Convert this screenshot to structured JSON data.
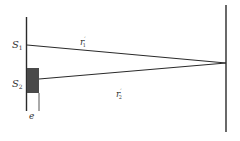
{
  "diagram": {
    "type": "double-slit interference with thin film over slit",
    "labels": {
      "s1": "S",
      "s1_sub": "1",
      "s2": "S",
      "s2_sub": "2",
      "r1": "r",
      "r1_sub": "1",
      "r1_prime": "′",
      "r2": "r",
      "r2_sub": "2",
      "r2_prime": "′",
      "thickness": "e"
    },
    "colors": {
      "line": "#2a2a2a",
      "film": "#4a4a4a",
      "background": "#ffffff"
    }
  }
}
